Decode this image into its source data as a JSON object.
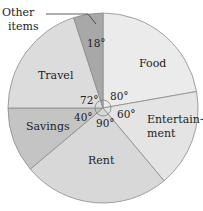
{
  "chart_data": {
    "type": "pie",
    "title": "",
    "unit": "degrees",
    "start_angle": "12 o'clock, clockwise",
    "categories": [
      "Food",
      "Entertainment",
      "Rent",
      "Savings",
      "Travel",
      "Other items"
    ],
    "values": [
      80,
      60,
      90,
      40,
      72,
      18
    ],
    "value_labels": [
      "80°",
      "60°",
      "90°",
      "40°",
      "72°",
      "18°"
    ],
    "colors": [
      "#ebebeb",
      "#e4e4e4",
      "#d8d8d8",
      "#c4c4c4",
      "#dcdcdc",
      "#a8a8a8"
    ],
    "legend": "none (labels in slices, 'Other items' via leader line)"
  },
  "labels": {
    "food": "Food",
    "entertainment_line1": "Entertain-",
    "entertainment_line2": "ment",
    "rent": "Rent",
    "savings": "Savings",
    "travel": "Travel",
    "other_line1": "Other",
    "other_line2": "items"
  },
  "degrees": {
    "food": "80°",
    "entertainment": "60°",
    "rent": "90°",
    "savings": "40°",
    "travel": "72°",
    "other": "18°"
  }
}
